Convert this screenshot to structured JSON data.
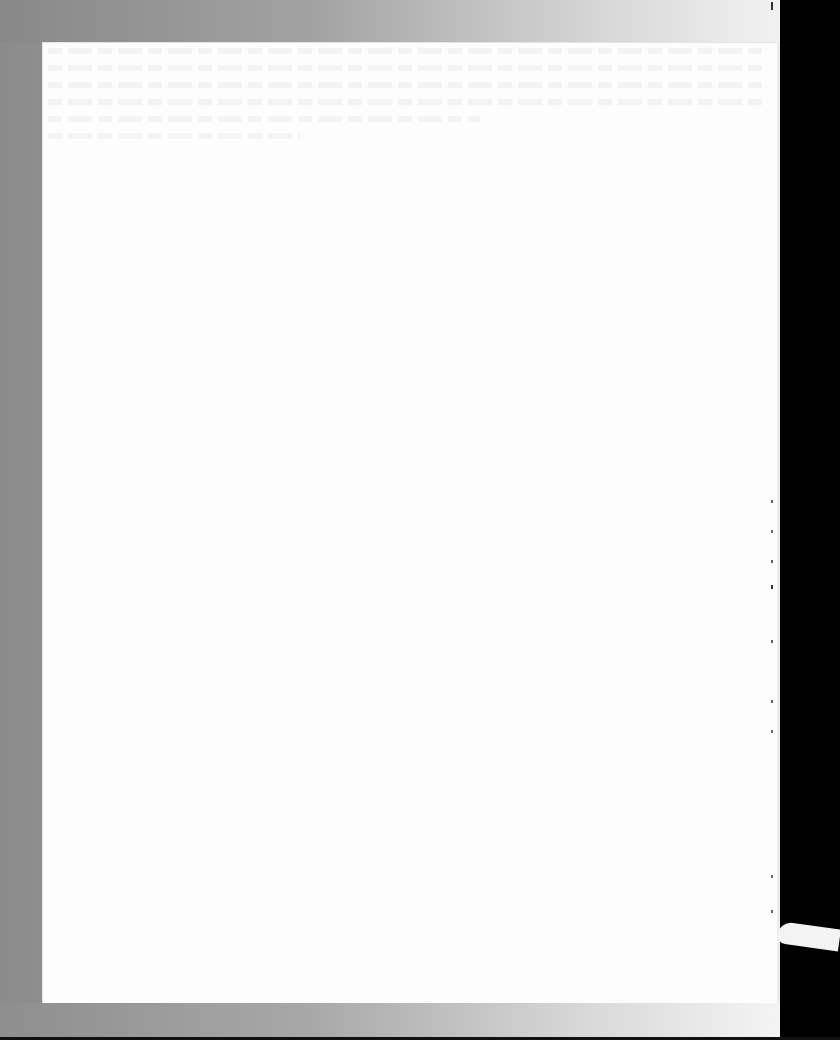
{
  "document": {
    "type": "scanned-blank-page",
    "visible_text": "",
    "colors": {
      "page": "#fdfdfd",
      "scanner_bed_left": "#8b8b8b",
      "scanner_bed_right": "#ececec",
      "background": "#000000"
    }
  }
}
